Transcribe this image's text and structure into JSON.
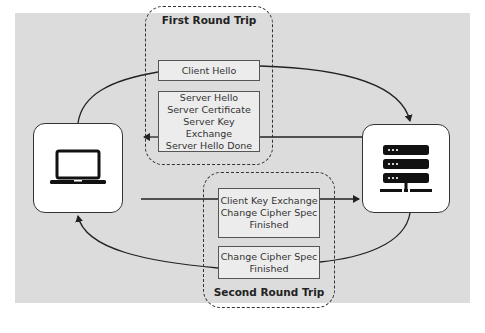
{
  "diagram": {
    "nodes": {
      "client": {
        "label": "Client",
        "icon": "laptop-icon"
      },
      "server": {
        "label": "Server",
        "icon": "server-icon"
      }
    },
    "groups": {
      "first": {
        "title": "First Round Trip",
        "messages": [
          {
            "lines": [
              "Client Hello"
            ],
            "direction": "client-to-server"
          },
          {
            "lines": [
              "Server Hello",
              "Server Certificate",
              "Server Key Exchange",
              "Server Hello Done"
            ],
            "direction": "server-to-client"
          }
        ]
      },
      "second": {
        "title": "Second Round Trip",
        "messages": [
          {
            "lines": [
              "Client Key Exchange",
              "Change Cipher Spec",
              "Finished"
            ],
            "direction": "client-to-server"
          },
          {
            "lines": [
              "Change Cipher Spec",
              "Finished"
            ],
            "direction": "server-to-client"
          }
        ]
      }
    },
    "colors": {
      "background": "#dcdcdc",
      "message_fill": "#ececec",
      "stroke": "#333333"
    }
  }
}
